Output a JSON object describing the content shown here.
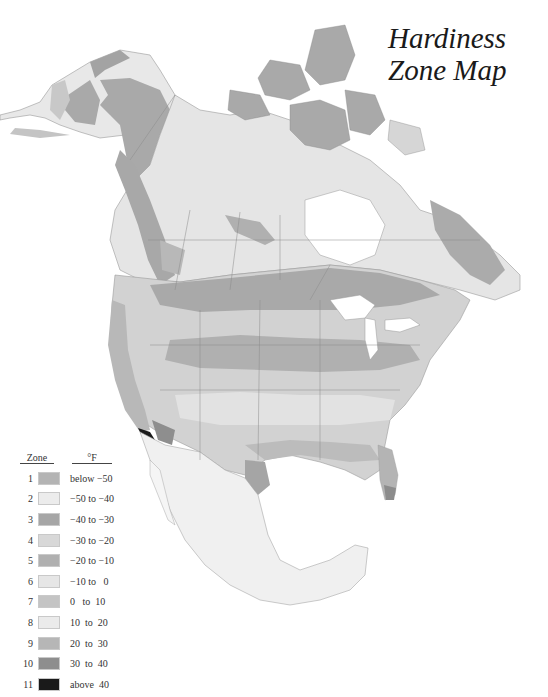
{
  "title": {
    "line1": "Hardiness",
    "line2": "Zone Map"
  },
  "legend": {
    "header_zone": "Zone",
    "header_temp": "°F",
    "items": [
      {
        "zone": "1",
        "range": "below −50",
        "color": "#b4b4b4"
      },
      {
        "zone": "2",
        "range": "−50 to −40",
        "color": "#ececec"
      },
      {
        "zone": "3",
        "range": "−40 to −30",
        "color": "#a6a6a6"
      },
      {
        "zone": "4",
        "range": "−30 to −20",
        "color": "#d8d8d8"
      },
      {
        "zone": "5",
        "range": "−20 to −10",
        "color": "#b0b0b0"
      },
      {
        "zone": "6",
        "range": "−10 to   0",
        "color": "#e6e6e6"
      },
      {
        "zone": "7",
        "range": "0   to  10",
        "color": "#c4c4c4"
      },
      {
        "zone": "8",
        "range": "10  to  20",
        "color": "#ebebeb"
      },
      {
        "zone": "9",
        "range": "20  to  30",
        "color": "#b6b6b6"
      },
      {
        "zone": "10",
        "range": "30  to  40",
        "color": "#8e8e8e"
      },
      {
        "zone": "11",
        "range": "above  40",
        "color": "#1a1a1a"
      }
    ]
  },
  "map": {
    "region": "North America",
    "labels": []
  }
}
